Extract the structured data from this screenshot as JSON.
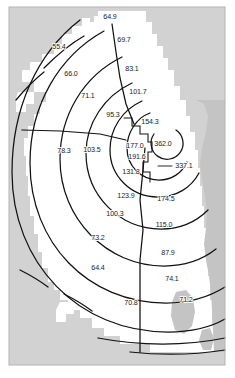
{
  "figure": {
    "region_name": "Metropolitan area",
    "background_color": "#d2d2d2",
    "land_color": "#ffffff",
    "water_color": "#c4c4c4",
    "contour_color": "#111111",
    "label_color": "#1a1a1a",
    "page_color": "#ffffff"
  },
  "chart_data": {
    "type": "contour-map",
    "xlabel": "",
    "ylabel": "",
    "grid": false,
    "legend_position": "none",
    "value_count": 24,
    "min_value": 55.4,
    "max_value": 362.0,
    "core_value": 362.0,
    "points": [
      {
        "id": "p01",
        "label": "64.9",
        "value": 64.9,
        "x": 110,
        "y": 17,
        "ring": 6,
        "sector": "north"
      },
      {
        "id": "p02",
        "label": "69.7",
        "value": 69.7,
        "x": 124,
        "y": 40,
        "ring": 5,
        "sector": "north"
      },
      {
        "id": "p03",
        "label": "55.4",
        "value": 55.4,
        "x": 59,
        "y": 47,
        "ring": 7,
        "sector": "northwest"
      },
      {
        "id": "p04",
        "label": "83.1",
        "value": 83.1,
        "x": 132,
        "y": 69,
        "ring": 4,
        "sector": "north-northeast"
      },
      {
        "id": "p05",
        "label": "66.0",
        "value": 66.0,
        "x": 71,
        "y": 74,
        "ring": 6,
        "sector": "northwest"
      },
      {
        "id": "p06",
        "label": "71.1",
        "value": 71.1,
        "x": 88,
        "y": 96,
        "ring": 5,
        "sector": "west-northwest"
      },
      {
        "id": "p07",
        "label": "101.7",
        "value": 101.7,
        "x": 138,
        "y": 92,
        "ring": 3,
        "sector": "northeast"
      },
      {
        "id": "p08",
        "label": "95.3",
        "value": 95.3,
        "x": 113,
        "y": 115,
        "ring": 4,
        "sector": "west-northwest"
      },
      {
        "id": "p09",
        "label": "154.3",
        "value": 154.3,
        "x": 150,
        "y": 122,
        "ring": 2,
        "sector": "northeast"
      },
      {
        "id": "p10",
        "label": "177.0",
        "value": 177.0,
        "x": 135,
        "y": 146,
        "ring": 1,
        "sector": "west"
      },
      {
        "id": "p11",
        "label": "362.0",
        "value": 362.0,
        "x": 163,
        "y": 144,
        "ring": 0,
        "sector": "core"
      },
      {
        "id": "p12",
        "label": "191.6",
        "value": 191.6,
        "x": 137,
        "y": 157,
        "ring": 1,
        "sector": "west-southwest"
      },
      {
        "id": "p13",
        "label": "78.3",
        "value": 78.3,
        "x": 64,
        "y": 151,
        "ring": 6,
        "sector": "west"
      },
      {
        "id": "p14",
        "label": "103.5",
        "value": 103.5,
        "x": 92,
        "y": 150,
        "ring": 5,
        "sector": "west"
      },
      {
        "id": "p15",
        "label": "131.8",
        "value": 131.8,
        "x": 131,
        "y": 172,
        "ring": 2,
        "sector": "southwest"
      },
      {
        "id": "p16",
        "label": "337.1",
        "value": 337.1,
        "x": 184,
        "y": 166,
        "ring": 0,
        "sector": "east-leader"
      },
      {
        "id": "p17",
        "label": "123.9",
        "value": 123.9,
        "x": 126,
        "y": 196,
        "ring": 3,
        "sector": "south-southwest"
      },
      {
        "id": "p18",
        "label": "174.5",
        "value": 174.5,
        "x": 166,
        "y": 199,
        "ring": 2,
        "sector": "south-southeast"
      },
      {
        "id": "p19",
        "label": "100.3",
        "value": 100.3,
        "x": 115,
        "y": 214,
        "ring": 4,
        "sector": "southwest"
      },
      {
        "id": "p20",
        "label": "115.0",
        "value": 115.0,
        "x": 164,
        "y": 225,
        "ring": 3,
        "sector": "southeast"
      },
      {
        "id": "p21",
        "label": "73.2",
        "value": 73.2,
        "x": 98,
        "y": 238,
        "ring": 5,
        "sector": "southwest"
      },
      {
        "id": "p22",
        "label": "87.9",
        "value": 87.9,
        "x": 168,
        "y": 253,
        "ring": 4,
        "sector": "southeast"
      },
      {
        "id": "p23",
        "label": "64.4",
        "value": 64.4,
        "x": 98,
        "y": 268,
        "ring": 6,
        "sector": "southwest"
      },
      {
        "id": "p24",
        "label": "74.1",
        "value": 74.1,
        "x": 172,
        "y": 279,
        "ring": 5,
        "sector": "south-southeast"
      },
      {
        "id": "p25",
        "label": "70.8",
        "value": 70.8,
        "x": 131,
        "y": 303,
        "ring": 6,
        "sector": "south"
      },
      {
        "id": "p26",
        "label": "71.2",
        "value": 71.2,
        "x": 186,
        "y": 300,
        "ring": 6,
        "sector": "southeast"
      }
    ]
  }
}
